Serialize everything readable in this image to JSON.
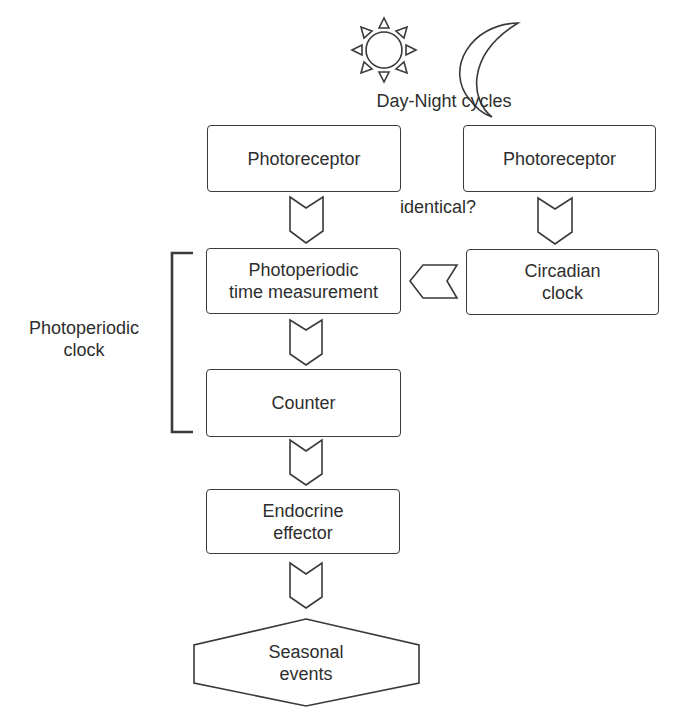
{
  "diagram": {
    "type": "flowchart",
    "colors": {
      "stroke": "#3a3a3a",
      "text": "#2e2e2e",
      "background": "#ffffff"
    },
    "top": {
      "icons": [
        "sun-icon",
        "moon-icon"
      ],
      "caption": "Day-Night cycles"
    },
    "nodes": {
      "photoreceptor_left": "Photoreceptor",
      "photoreceptor_right": "Photoreceptor",
      "photoperiodic_time_measurement": "Photoperiodic\ntime measurement",
      "circadian_clock": "Circadian\nclock",
      "counter": "Counter",
      "endocrine_effector": "Endocrine\neffector",
      "seasonal_events": "Seasonal\nevents"
    },
    "annotations": {
      "identical": "identical?",
      "group_label": "Photoperiodic\nclock"
    },
    "edges": [
      {
        "from": "photoreceptor_left",
        "to": "photoperiodic_time_measurement"
      },
      {
        "from": "photoreceptor_right",
        "to": "circadian_clock"
      },
      {
        "from": "circadian_clock",
        "to": "photoperiodic_time_measurement"
      },
      {
        "from": "photoperiodic_time_measurement",
        "to": "counter"
      },
      {
        "from": "counter",
        "to": "endocrine_effector"
      },
      {
        "from": "endocrine_effector",
        "to": "seasonal_events"
      }
    ],
    "groups": [
      {
        "label": "Photoperiodic\nclock",
        "members": [
          "photoperiodic_time_measurement",
          "counter"
        ]
      }
    ]
  }
}
